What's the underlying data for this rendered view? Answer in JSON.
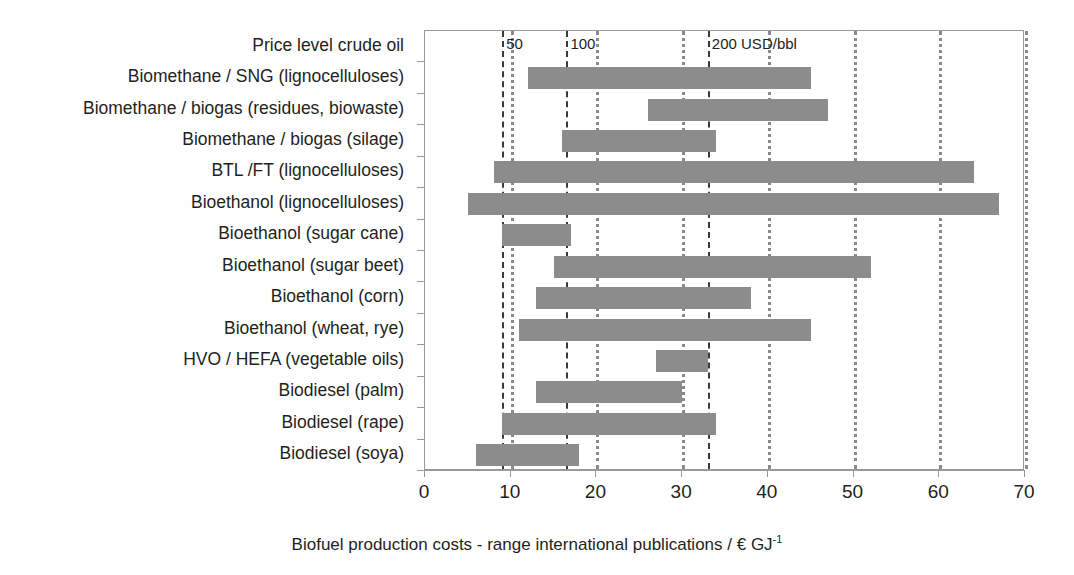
{
  "chart_data": {
    "type": "bar",
    "orientation": "horizontal",
    "subtype": "range-bar",
    "title": "",
    "xlabel": "Biofuel production costs - range international publications / € GJ-1",
    "xlabel_parts": {
      "main": "Biofuel production costs - range international publications / € GJ",
      "superscript": "-1"
    },
    "ylabel": "",
    "xlim": [
      0,
      70
    ],
    "xticks": [
      0,
      10,
      20,
      30,
      40,
      50,
      60,
      70
    ],
    "xticklabels": [
      "0",
      "10",
      "20",
      "30",
      "40",
      "50",
      "60",
      "70"
    ],
    "grid": "vertical dotted gridlines at every x tick",
    "legend": "none",
    "bar_color": "#8c8c8c",
    "gridline_color": "#8a8a8a",
    "priceline_color": "#3a3a3a",
    "categories": [
      "Price level crude oil",
      "Biomethane / SNG (lignocelluloses)",
      "Biomethane / biogas (residues, biowaste)",
      "Biomethane / biogas (silage)",
      "BTL /FT (lignocelluloses)",
      "Bioethanol (lignocelluloses)",
      "Bioethanol (sugar cane)",
      "Bioethanol (sugar beet)",
      "Bioethanol (corn)",
      "Bioethanol (wheat, rye)",
      "HVO / HEFA (vegetable oils)",
      "Biodiesel (palm)",
      "Biodiesel (rape)",
      "Biodiesel (soya)"
    ],
    "ranges": [
      {
        "category": "Price level crude oil",
        "low": null,
        "high": null
      },
      {
        "category": "Biomethane / SNG (lignocelluloses)",
        "low": 12,
        "high": 45
      },
      {
        "category": "Biomethane / biogas (residues, biowaste)",
        "low": 26,
        "high": 47
      },
      {
        "category": "Biomethane / biogas (silage)",
        "low": 16,
        "high": 34
      },
      {
        "category": "BTL /FT (lignocelluloses)",
        "low": 8,
        "high": 64
      },
      {
        "category": "Bioethanol (lignocelluloses)",
        "low": 5,
        "high": 67
      },
      {
        "category": "Bioethanol (sugar cane)",
        "low": 9,
        "high": 17
      },
      {
        "category": "Bioethanol (sugar beet)",
        "low": 15,
        "high": 52
      },
      {
        "category": "Bioethanol (corn)",
        "low": 13,
        "high": 38
      },
      {
        "category": "Bioethanol (wheat, rye)",
        "low": 11,
        "high": 45
      },
      {
        "category": "HVO / HEFA (vegetable oils)",
        "low": 27,
        "high": 33
      },
      {
        "category": "Biodiesel (palm)",
        "low": 13,
        "high": 30
      },
      {
        "category": "Biodiesel (rape)",
        "low": 9,
        "high": 34
      },
      {
        "category": "Biodiesel (soya)",
        "low": 6,
        "high": 18
      }
    ],
    "reference_lines": [
      {
        "label": "50",
        "value": 9,
        "unit": "USD/bbl",
        "style": "dashed"
      },
      {
        "label": "100",
        "value": 16.5,
        "unit": "USD/bbl",
        "style": "dashed"
      },
      {
        "label": "200 USD/bbl",
        "value": 33,
        "unit": "USD/bbl",
        "style": "dashed"
      }
    ],
    "annotations": [
      "50",
      "100",
      "200 USD/bbl"
    ]
  }
}
